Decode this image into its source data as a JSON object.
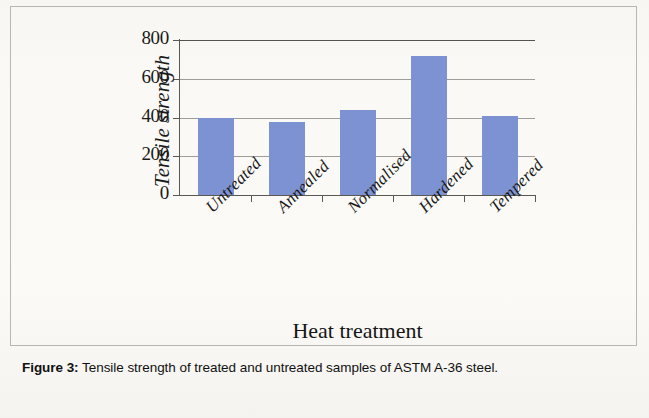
{
  "figure": {
    "caption_label": "Figure 3:",
    "caption_text": " Tensile strength of treated and untreated samples of ASTM A-36 steel."
  },
  "chart_data": {
    "type": "bar",
    "title": "",
    "categories": [
      "Untreated",
      "Annealed",
      "Normalised",
      "Hardened",
      "Tempered"
    ],
    "values": [
      395,
      378,
      440,
      718,
      408
    ],
    "series": [
      {
        "name": "Tensile strength",
        "values": [
          395,
          378,
          440,
          718,
          408
        ]
      }
    ],
    "xlabel": "Heat treatment",
    "ylabel": "Tensile strength",
    "ylim": [
      0,
      800
    ],
    "ytick_labels": [
      "0",
      "200",
      "400",
      "600",
      "800"
    ],
    "ytick_values": [
      0,
      200,
      400,
      600,
      800
    ],
    "grid": true,
    "grid_axis": "y",
    "legend": false,
    "legend_position": "none",
    "bar_color": "#7d92d3",
    "axis_color": "#5a5854",
    "text_color": "#1a1a1a",
    "background_color": "#faf9f6"
  }
}
